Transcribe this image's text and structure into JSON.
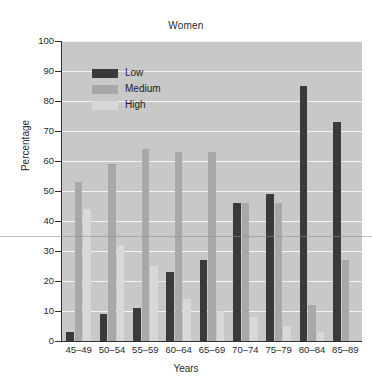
{
  "chart_data": {
    "type": "bar",
    "title": "Women",
    "xlabel": "Years",
    "ylabel": "Percentage",
    "categories": [
      "45–49",
      "50–54",
      "55–59",
      "60–64",
      "65–69",
      "70–74",
      "75–79",
      "80–84",
      "85–89"
    ],
    "series": [
      {
        "name": "Low",
        "color": "#3a3a3a",
        "values": [
          3,
          9,
          11,
          23,
          27,
          46,
          49,
          85,
          73
        ]
      },
      {
        "name": "Medium",
        "color": "#a8a8a8",
        "values": [
          53,
          59,
          64,
          63,
          63,
          46,
          46,
          12,
          27
        ]
      },
      {
        "name": "High",
        "color": "#d8d8d8",
        "values": [
          44,
          32,
          25,
          14,
          10,
          8,
          5,
          3,
          0
        ]
      }
    ],
    "ylim": [
      0,
      100
    ],
    "yticks": [
      0,
      10,
      20,
      30,
      40,
      50,
      60,
      70,
      80,
      90,
      100
    ],
    "grid": true,
    "legend_position": "upper-left",
    "plot_background": "#c8c8c8",
    "gridline_color": "#f2f2f2"
  },
  "legend": {
    "items": [
      {
        "label": "Low"
      },
      {
        "label": "Medium"
      },
      {
        "label": "High"
      }
    ]
  }
}
